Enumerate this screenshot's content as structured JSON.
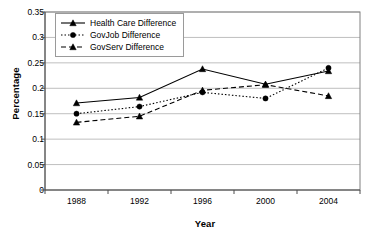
{
  "chart_data": {
    "type": "line",
    "title": "",
    "xlabel": "Year",
    "ylabel": "Percentage",
    "categories": [
      "1988",
      "1992",
      "1996",
      "2000",
      "2004"
    ],
    "ylim": [
      0,
      0.35
    ],
    "yticks": [
      "0",
      "0.05",
      "0.1",
      "0.15",
      "0.2",
      "0.25",
      "0.3",
      "0.35"
    ],
    "ytick_values": [
      0,
      0.05,
      0.1,
      0.15,
      0.2,
      0.25,
      0.3,
      0.35
    ],
    "grid": "horizontal",
    "legend_position": "top-left-inside",
    "series": [
      {
        "name": "Health Care Difference",
        "values": [
          0.171,
          0.182,
          0.238,
          0.208,
          0.234
        ],
        "line_style": "solid",
        "marker": "triangle",
        "color": "#000000"
      },
      {
        "name": "GovJob Difference",
        "values": [
          0.15,
          0.164,
          0.192,
          0.18,
          0.24
        ],
        "line_style": "dotted",
        "marker": "circle",
        "color": "#000000"
      },
      {
        "name": "GovServ Difference",
        "values": [
          0.133,
          0.145,
          0.196,
          0.207,
          0.185
        ],
        "line_style": "dashed",
        "marker": "triangle",
        "color": "#000000"
      }
    ]
  },
  "axes": {
    "y_title": "Percentage",
    "x_title": "Year"
  },
  "colors": {
    "gridline": "#bfbfbf",
    "frame": "#808080",
    "series": "#000000",
    "background": "#ffffff"
  }
}
